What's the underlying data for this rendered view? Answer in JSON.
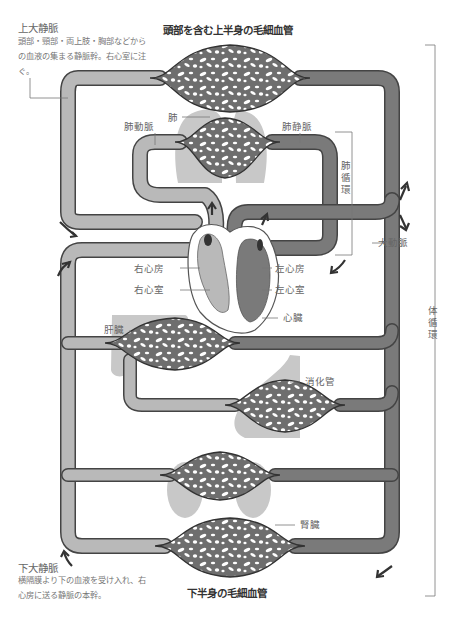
{
  "titles": {
    "top": "頭部を含む上半身の毛細血管",
    "bottom": "下半身の毛細血管"
  },
  "notes": {
    "superior_vena_cava": {
      "heading": "上大静脈",
      "body": "頭部・頸部・両上肢・胸部などからの血液の集まる静脈幹。右心室に注ぐ。"
    },
    "inferior_vena_cava": {
      "heading": "下大静脈",
      "body": "横隔膜より下の血液を受け入れ、右心房に送る静脈の本幹。"
    }
  },
  "labels": {
    "lung": "肺",
    "pulmonary_artery": "肺動脈",
    "pulmonary_vein": "肺静脈",
    "pulmonary_circulation": "肺循環",
    "aorta": "大動脈",
    "systemic_circulation": "体循環",
    "right_atrium": "右心房",
    "right_ventricle": "右心室",
    "left_atrium": "左心房",
    "left_ventricle": "左心室",
    "heart": "心臓",
    "liver": "肝臓",
    "digestive_tract": "消化管",
    "kidney": "腎臓"
  },
  "colors": {
    "venous": "#b9b9b9",
    "arterial": "#7a7a7a",
    "outline": "#444444",
    "organ": "#c8c8c8",
    "capillary_fill": "#6e6e6e",
    "background": "#ffffff"
  }
}
